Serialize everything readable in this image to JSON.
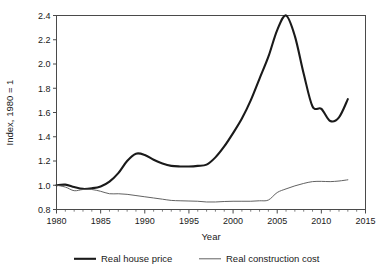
{
  "chart_data": {
    "type": "line",
    "title": "",
    "subtitle": "",
    "xlabel": "Year",
    "ylabel": "Index, 1980 = 1",
    "xlim": [
      1980,
      2015
    ],
    "ylim": [
      0.8,
      2.4
    ],
    "xticks": [
      1980,
      1985,
      1990,
      1995,
      2000,
      2005,
      2010,
      2015
    ],
    "xtick_labels": [
      "1980",
      "1985",
      "1990",
      "1995",
      "2000",
      "2005",
      "2010",
      "2015"
    ],
    "yticks": [
      0.8,
      1.0,
      1.2,
      1.4,
      1.6,
      1.8,
      2.0,
      2.2,
      2.4
    ],
    "ytick_labels": [
      "0.8",
      "1.0",
      "1.2",
      "1.4",
      "1.6",
      "1.8",
      "2.0",
      "2.2",
      "2.4"
    ],
    "grid": false,
    "minor_xticks": true,
    "legend_position": "bottom-outside",
    "frame": "box",
    "x": [
      1980,
      1981,
      1982,
      1983,
      1984,
      1985,
      1986,
      1987,
      1988,
      1989,
      1990,
      1991,
      1992,
      1993,
      1994,
      1995,
      1996,
      1997,
      1998,
      1999,
      2000,
      2001,
      2002,
      2003,
      2004,
      2005,
      2006,
      2007,
      2008,
      2009,
      2010,
      2011,
      2012,
      2013
    ],
    "series": [
      {
        "name": "Real house price",
        "color": "#1a1a1a",
        "line_width": 2.1,
        "values": [
          1.0,
          1.005,
          0.985,
          0.97,
          0.975,
          0.99,
          1.03,
          1.1,
          1.2,
          1.26,
          1.25,
          1.21,
          1.18,
          1.16,
          1.155,
          1.155,
          1.16,
          1.17,
          1.23,
          1.32,
          1.43,
          1.55,
          1.7,
          1.88,
          2.06,
          2.28,
          2.4,
          2.23,
          1.92,
          1.65,
          1.63,
          1.53,
          1.56,
          1.71
        ]
      },
      {
        "name": "Real construction cost",
        "color": "#5a5a5a",
        "line_width": 0.95,
        "values": [
          1.0,
          0.985,
          0.955,
          0.965,
          0.965,
          0.95,
          0.93,
          0.93,
          0.925,
          0.915,
          0.905,
          0.895,
          0.885,
          0.875,
          0.872,
          0.87,
          0.868,
          0.862,
          0.862,
          0.866,
          0.868,
          0.868,
          0.868,
          0.872,
          0.878,
          0.94,
          0.97,
          0.995,
          1.015,
          1.03,
          1.032,
          1.03,
          1.035,
          1.045
        ]
      }
    ],
    "legend": [
      {
        "label": "Real house price",
        "color": "#1a1a1a",
        "line_width": 2.1
      },
      {
        "label": "Real construction cost",
        "color": "#5a5a5a",
        "line_width": 0.95
      }
    ]
  }
}
